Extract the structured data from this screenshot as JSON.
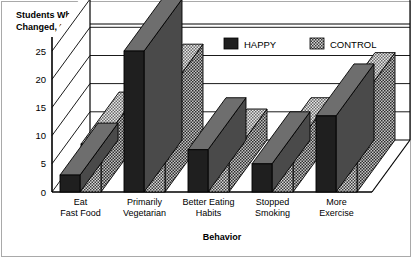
{
  "chart_data": {
    "type": "bar",
    "title": "Students Who Changed, %",
    "title_line1": "Students Who",
    "title_line2": "Changed, %",
    "xlabel": "Behavior",
    "ylabel": "Students Who Changed, %",
    "ylim": [
      0,
      27.5
    ],
    "yticks": [
      0,
      5,
      10,
      15,
      20,
      25
    ],
    "ytick_labels": [
      "0",
      "5",
      "10",
      "15",
      "20",
      "25"
    ],
    "grid": true,
    "grid_orientation": "horizontal",
    "legend_position": "top-right",
    "threed": true,
    "categories": [
      "Eat Fast Food",
      "Primarily Vegetarian",
      "Better Eating Habits",
      "Stopped Smoking",
      "More Exercise"
    ],
    "category_lines": [
      [
        "Eat",
        "Fast Food"
      ],
      [
        "Primarily",
        "Vegetarian"
      ],
      [
        "Better Eating",
        "Habits"
      ],
      [
        "Stopped",
        "Smoking"
      ],
      [
        "More",
        "Exercise"
      ]
    ],
    "series": [
      {
        "name": "HAPPY",
        "color": "#1a1a1a",
        "values": [
          3,
          25,
          7.5,
          5,
          13.5
        ]
      },
      {
        "name": "CONTROL",
        "color": "#9a9a9a",
        "values": [
          8.5,
          17,
          5.5,
          7.5,
          15.5
        ]
      }
    ]
  },
  "legend": {
    "items": [
      {
        "label": "HAPPY",
        "swatch": "dark"
      },
      {
        "label": "CONTROL",
        "swatch": "hatched"
      }
    ]
  },
  "colors": {
    "happy_front": "#1f1f1f",
    "happy_top": "#6e6e6e",
    "happy_side": "#4a4a4a",
    "control_front": "#a8a8a8",
    "control_top": "#cfcfcf",
    "control_side": "#8f8f8f",
    "frame": "#000000",
    "background": "#ffffff"
  }
}
